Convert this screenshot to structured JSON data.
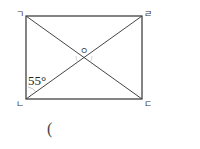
{
  "figure": {
    "shape": "rectangle",
    "vertices": {
      "top_left": "ㄱ",
      "bottom_left": "ㄴ",
      "bottom_right": "ㄷ",
      "top_right": "ㄹ"
    },
    "center_label": "ㅇ",
    "angle_label": "55°",
    "answer_blank": "("
  }
}
